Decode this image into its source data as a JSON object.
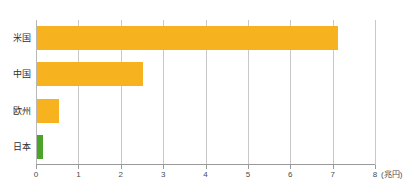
{
  "chart_data": {
    "type": "bar",
    "orientation": "horizontal",
    "title": "",
    "subtitle": "",
    "categories": [
      "米国",
      "中国",
      "欧州",
      "日本"
    ],
    "values": [
      7.1,
      2.5,
      0.52,
      0.15
    ],
    "series": [
      {
        "name": "",
        "values": [
          7.1,
          2.5,
          0.52,
          0.15
        ]
      }
    ],
    "bar_colors": [
      "#f7b220",
      "#f7b220",
      "#f7b220",
      "#4ca32a"
    ],
    "xlabel": "",
    "ylabel": "",
    "unit": "(兆円)",
    "xlim": [
      0,
      8
    ],
    "xticks": [
      0,
      1,
      2,
      3,
      4,
      5,
      6,
      7,
      8
    ],
    "xtick_labels": [
      "0",
      "1",
      "2",
      "3",
      "4",
      "5",
      "6",
      "7",
      "8"
    ],
    "grid": true,
    "grid_axis": "x",
    "legend": false,
    "legend_position": "none",
    "annotations": []
  },
  "colors": {
    "bar_orange": "#f7b220",
    "bar_green": "#4ca32a",
    "gridline": "#c8c8c8",
    "axis": "#9a9a9a",
    "text": "#3a3a3a",
    "background": "#ffffff"
  }
}
